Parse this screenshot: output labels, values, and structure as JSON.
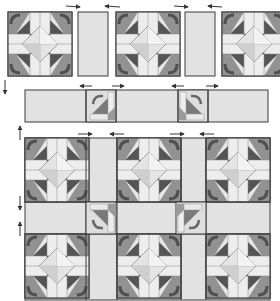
{
  "diagram": {
    "type": "quilt-assembly",
    "colors": {
      "outline": "#3a3a3a",
      "sashing": "#e2e2e2",
      "light": "#ececec",
      "pale": "#d6d6d6",
      "medium": "#9a9a9a",
      "dark": "#5a5a5a",
      "darkest": "#4a4a4a",
      "arrow": "#333333"
    },
    "top_row": {
      "blocks": [
        {
          "variant": "dark"
        },
        {
          "variant": "mixed"
        },
        {
          "variant": "medium-partial"
        }
      ],
      "sashing_count": 2,
      "pressing_arrows": [
        "right",
        "left",
        "right",
        "left"
      ]
    },
    "sashing_row": {
      "cornerstones": 2,
      "pressing_arrows_top": [
        "left",
        "right",
        "left",
        "right"
      ],
      "pressing_arrows_bottom": [
        "right",
        "left",
        "right",
        "left"
      ]
    },
    "assembled_quilt": {
      "rows": 2,
      "cols": 3,
      "sashing_cornerstones": 2
    },
    "side_arrows": [
      "down",
      "up",
      "down",
      "up"
    ]
  }
}
